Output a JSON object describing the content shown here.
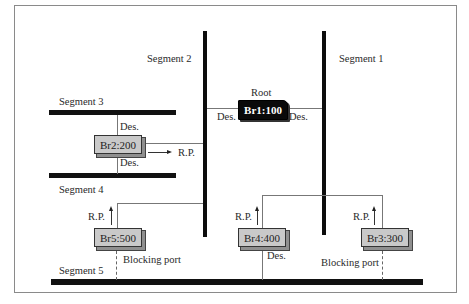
{
  "diagram": {
    "type": "spanning-tree-topology",
    "segments": [
      {
        "id": "segment-1",
        "label": "Segment 1"
      },
      {
        "id": "segment-2",
        "label": "Segment 2"
      },
      {
        "id": "segment-3",
        "label": "Segment 3"
      },
      {
        "id": "segment-4",
        "label": "Segment 4"
      },
      {
        "id": "segment-5",
        "label": "Segment 5"
      }
    ],
    "bridges": [
      {
        "id": "br1",
        "label": "Br1:100",
        "role": "Root"
      },
      {
        "id": "br2",
        "label": "Br2:200"
      },
      {
        "id": "br3",
        "label": "Br3:300"
      },
      {
        "id": "br4",
        "label": "Br4:400"
      },
      {
        "id": "br5",
        "label": "Br5:500"
      }
    ],
    "port_labels": {
      "designated": "Des.",
      "root_port": "R.P.",
      "blocking": "Blocking port"
    },
    "root_label": "Root"
  }
}
